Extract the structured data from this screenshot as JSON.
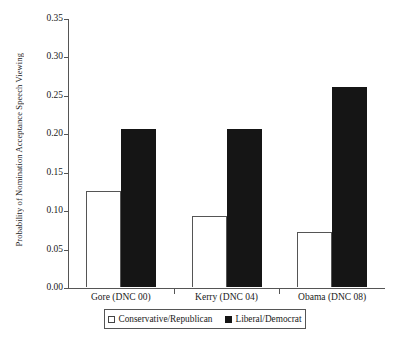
{
  "chart_data": {
    "type": "bar",
    "title": "",
    "xlabel": "",
    "ylabel": "Probability of Nomination Acceptance Speech Viewing",
    "ylim": [
      0.0,
      0.35
    ],
    "ytick_step": 0.05,
    "ytick_labels": [
      "0.35",
      "0.30",
      "0.25",
      "0.20",
      "0.15",
      "0.10",
      "0.05",
      "0.00"
    ],
    "ytick_values": [
      0.35,
      0.3,
      0.25,
      0.2,
      0.15,
      0.1,
      0.05,
      0.0
    ],
    "grid": false,
    "legend_position": "bottom-center",
    "categories": [
      "Gore (DNC 00)",
      "Kerry (DNC 04)",
      "Obama (DNC 08)"
    ],
    "series": [
      {
        "name": "Conservative/Republican",
        "style": "open",
        "color": "#ffffff",
        "edge_color": "#555555",
        "values": [
          0.125,
          0.092,
          0.071
        ]
      },
      {
        "name": "Liberal/Democrat",
        "style": "filled",
        "color": "#151515",
        "edge_color": "#151515",
        "values": [
          0.206,
          0.205,
          0.26
        ]
      }
    ]
  }
}
